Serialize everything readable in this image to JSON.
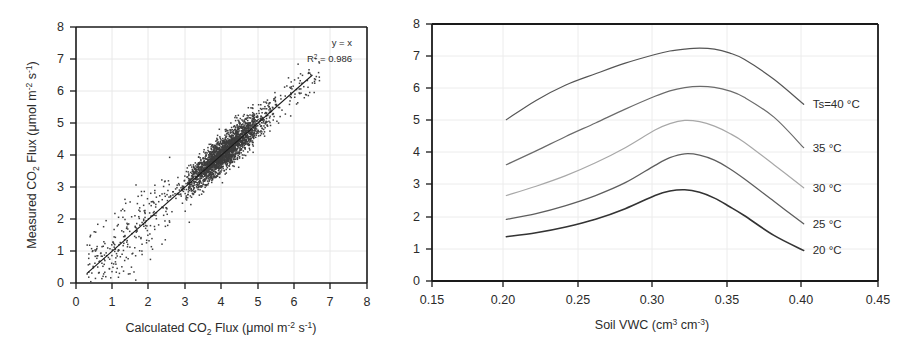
{
  "figure": {
    "background": "#ffffff",
    "panels": [
      "scatter-panel",
      "response-curves-panel"
    ]
  },
  "chart_data": [
    {
      "id": "left",
      "type": "scatter",
      "title": "",
      "xlabel": "Calculated CO2 Flux (μmol m-2 s-1)",
      "xlabel_parts": {
        "pre": "Calculated CO",
        "sub1": "2",
        "mid": " Flux (μmol m",
        "sup1": "-2",
        "mid2": " s",
        "sup2": "-1",
        "post": ")"
      },
      "ylabel": "Measured CO2 Flux (μmol m-2 s-1)",
      "ylabel_parts": {
        "pre": "Measured CO",
        "sub1": "2",
        "mid": " Flux (μmol m",
        "sup1": "-2",
        "mid2": " s",
        "sup2": "-1",
        "post": ")"
      },
      "xlim": [
        0,
        8
      ],
      "ylim": [
        0,
        8
      ],
      "xticks": [
        0,
        1,
        2,
        3,
        4,
        5,
        6,
        7,
        8
      ],
      "yticks": [
        0,
        1,
        2,
        3,
        4,
        5,
        6,
        7,
        8
      ],
      "xtick_labels": [
        "0",
        "1",
        "2",
        "3",
        "4",
        "5",
        "6",
        "7",
        "8"
      ],
      "ytick_labels": [
        "0",
        "1",
        "2",
        "3",
        "4",
        "5",
        "6",
        "7",
        "8"
      ],
      "grid": true,
      "grid_color": "#e8e8e8",
      "axis_color": "#1a1a1a",
      "marker_color": "#3d3d3d",
      "marker_size": 1.5,
      "point_count_approx": 2600,
      "cloud": {
        "x_min": 0.3,
        "x_max": 6.7,
        "dense_x_min": 2.6,
        "dense_x_max": 5.6,
        "spread_sd": 0.3,
        "tail_spread_sd": 0.55,
        "description": "Points follow the 1:1 line with tight scatter; sparse scattered outliers below x=2.5"
      },
      "fit_line": {
        "label": "y = x",
        "slope": 1,
        "intercept": 0,
        "x_start": 0.3,
        "x_end": 6.5,
        "color": "#1a1a1a",
        "width": 1.1
      },
      "annotations": [
        {
          "text": "y = x",
          "x": 6.55,
          "y": 7.55
        },
        {
          "text": "R² = 0.986",
          "x": 6.55,
          "y": 7.1,
          "parts": {
            "pre": "R",
            "sup": "2",
            "post": " = 0.986"
          }
        }
      ]
    },
    {
      "id": "right",
      "type": "line",
      "title": "",
      "xlabel": "Soil VWC (cm3 cm-3)",
      "xlabel_parts": {
        "pre": "Soil VWC (cm",
        "sup1": "3",
        "mid": " cm",
        "sup2": "-3",
        "post": ")"
      },
      "ylabel": "CO2 Flux (umol m-2.S-1)",
      "ylabel_parts": {
        "pre": "CO",
        "sub1": "2",
        "mid": " Flux (umol m",
        "sup1": "-2",
        "mid2": ".S",
        "sup2": "-1",
        "post": ")"
      },
      "xlim": [
        0.15,
        0.45
      ],
      "ylim": [
        0,
        8
      ],
      "xticks": [
        0.15,
        0.2,
        0.25,
        0.3,
        0.35,
        0.4,
        0.45
      ],
      "yticks": [
        0,
        1,
        2,
        3,
        4,
        5,
        6,
        7,
        8
      ],
      "xtick_labels": [
        "0.15",
        "0.20",
        "0.25",
        "0.30",
        "0.35",
        "0.40",
        "0.45"
      ],
      "ytick_labels": [
        "0",
        "1",
        "2",
        "3",
        "4",
        "5",
        "6",
        "7",
        "8"
      ],
      "grid": true,
      "grid_color": "#ececec",
      "axis_color": "#1a1a1a",
      "legend_position": "right-of-curve-ends",
      "x": [
        0.2,
        0.22,
        0.24,
        0.26,
        0.28,
        0.3,
        0.31,
        0.32,
        0.33,
        0.34,
        0.35,
        0.36,
        0.38,
        0.4
      ],
      "series": [
        {
          "name": "Ts=40 °C",
          "label": "Ts=40 °C",
          "color": "#555555",
          "width": 1.2,
          "values": [
            5.02,
            5.62,
            6.1,
            6.45,
            6.78,
            7.05,
            7.16,
            7.22,
            7.25,
            7.22,
            7.1,
            6.9,
            6.28,
            5.5
          ]
        },
        {
          "name": "35 °C",
          "label": "35 °C",
          "color": "#6b6b6b",
          "width": 1.2,
          "values": [
            3.62,
            4.05,
            4.5,
            4.92,
            5.35,
            5.75,
            5.92,
            6.02,
            6.06,
            6.03,
            5.92,
            5.72,
            5.1,
            4.15
          ]
        },
        {
          "name": "30 °C",
          "label": "30 °C",
          "color": "#a8a8a8",
          "width": 1.2,
          "values": [
            2.66,
            2.95,
            3.28,
            3.68,
            4.15,
            4.7,
            4.9,
            5.0,
            4.96,
            4.82,
            4.6,
            4.32,
            3.62,
            2.9
          ]
        },
        {
          "name": "25 °C",
          "label": "25 °C",
          "color": "#5e5e5e",
          "width": 1.3,
          "values": [
            1.92,
            2.1,
            2.35,
            2.66,
            3.06,
            3.6,
            3.84,
            3.96,
            3.92,
            3.76,
            3.5,
            3.18,
            2.48,
            1.78
          ]
        },
        {
          "name": "20 °C",
          "label": "20 °C",
          "color": "#333333",
          "width": 1.6,
          "values": [
            1.38,
            1.5,
            1.68,
            1.92,
            2.25,
            2.66,
            2.8,
            2.84,
            2.76,
            2.58,
            2.32,
            2.04,
            1.42,
            0.95
          ]
        }
      ]
    }
  ]
}
